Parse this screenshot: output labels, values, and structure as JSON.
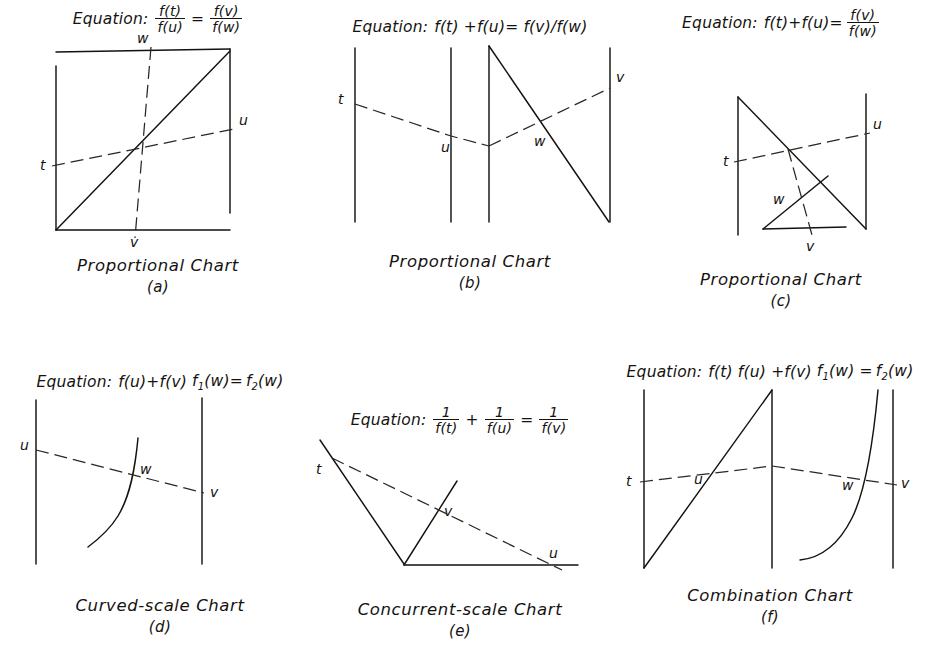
{
  "plate": {
    "title": "Types of Nomographic Charts",
    "equation_word": "Equation:",
    "variables": [
      "t",
      "u",
      "v",
      "w"
    ]
  },
  "charts": [
    {
      "id": "a",
      "type": "proportional",
      "caption": "Proportional Chart",
      "fig_label": "(a)",
      "equation_text": "f(t)/f(u) = f(v)/f(w)",
      "equation_parts": {
        "lhs_num": "f(t)",
        "lhs_den": "f(u)",
        "relation": "=",
        "rhs_num": "f(v)",
        "rhs_den": "f(w)"
      },
      "scales": [
        {
          "label": "t",
          "position": "left"
        },
        {
          "label": "u",
          "position": "right"
        },
        {
          "label": "v",
          "position": "bottom"
        },
        {
          "label": "w",
          "position": "top"
        }
      ]
    },
    {
      "id": "b",
      "type": "proportional",
      "caption": "Proportional Chart",
      "fig_label": "(b)",
      "equation_text": "f(t) + f(u) = f(v)/f(w)",
      "equation_parts": {
        "inline": "f(t) +f(u)= f(v)/f(w)"
      },
      "scales": [
        {
          "label": "t",
          "position": "left"
        },
        {
          "label": "u",
          "position": "middle-left"
        },
        {
          "label": "v",
          "position": "right"
        },
        {
          "label": "w",
          "position": "slant"
        }
      ]
    },
    {
      "id": "c",
      "type": "proportional",
      "caption": "Proportional Chart",
      "fig_label": "(c)",
      "equation_text": "f(t) + f(u) = f(v)/f(w)",
      "equation_parts": {
        "lhs_inline": "f(t)+f(u)=",
        "rhs_num": "f(v)",
        "rhs_den": "f(w)"
      },
      "scales": [
        {
          "label": "t",
          "position": "left"
        },
        {
          "label": "u",
          "position": "right"
        },
        {
          "label": "v",
          "position": "bottom"
        },
        {
          "label": "w",
          "position": "slant"
        }
      ]
    },
    {
      "id": "d",
      "type": "curved-scale",
      "caption": "Curved-scale Chart",
      "fig_label": "(d)",
      "equation_text": "f(u)+f(v)f1(w)=f2(w)",
      "equation_parts": {
        "inline_a": "f(u)+f(v)",
        "f1": "f",
        "f1_sub": "1",
        "f1_arg": "(w)=",
        "f2": "f",
        "f2_sub": "2",
        "f2_arg": "(w)"
      },
      "scales": [
        {
          "label": "u",
          "position": "left"
        },
        {
          "label": "v",
          "position": "right"
        },
        {
          "label": "w",
          "position": "curve"
        }
      ]
    },
    {
      "id": "e",
      "type": "concurrent-scale",
      "caption": "Concurrent-scale Chart",
      "fig_label": "(e)",
      "equation_text": "1/f(t) + 1/f(u) = 1/f(v)",
      "equation_parts": {
        "one": "1",
        "t_den": "f(t)",
        "plus": "+",
        "u_den": "f(u)",
        "relation": "=",
        "v_den": "f(v)"
      },
      "scales": [
        {
          "label": "t",
          "position": "upper-left"
        },
        {
          "label": "u",
          "position": "baseline-right"
        },
        {
          "label": "v",
          "position": "middle-slant"
        }
      ]
    },
    {
      "id": "f",
      "type": "combination",
      "caption": "Combination Chart",
      "fig_label": "(f)",
      "equation_text": "f(t) f(u) + f(v) f1(w) = f2(w)",
      "equation_parts": {
        "inline_a": "f(t) f(u) +f(v)",
        "f1": "f",
        "f1_sub": "1",
        "f1_arg": "(w) =",
        "f2": "f",
        "f2_sub": "2",
        "f2_arg": "(w)"
      },
      "scales": [
        {
          "label": "t",
          "position": "left"
        },
        {
          "label": "u",
          "position": "slant"
        },
        {
          "label": "w",
          "position": "curve"
        },
        {
          "label": "v",
          "position": "right"
        }
      ]
    }
  ]
}
